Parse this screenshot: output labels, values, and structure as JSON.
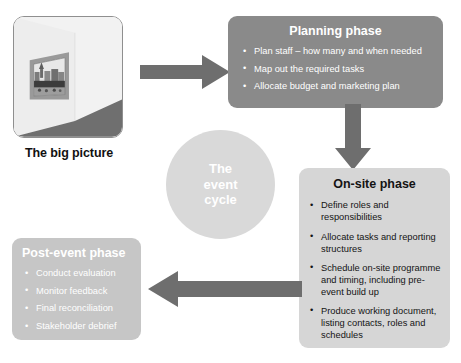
{
  "diagram": {
    "title": "The event cycle",
    "colors": {
      "dark_grey": "#8a8a8a",
      "mid_grey": "#c6c6c6",
      "light_grey": "#d6d6d6",
      "circle_grey": "#d9d9d9",
      "arrow_grey": "#6e6e6e",
      "text_dark": "#141414",
      "text_light": "#ffffff"
    }
  },
  "big_picture": {
    "label": "The big picture",
    "image_alt": "framed-painting-on-wall-in-room"
  },
  "center_circle": {
    "line1": "The",
    "line2": "event",
    "line3": "cycle"
  },
  "phases": [
    {
      "id": "planning",
      "title": "Planning phase",
      "bullets": [
        "Plan staff – how many and when needed",
        "Map out the required tasks",
        "Allocate budget and marketing plan"
      ]
    },
    {
      "id": "onsite",
      "title": "On-site phase",
      "bullets": [
        "Define roles and responsibilities",
        "Allocate tasks and reporting structures",
        "Schedule on-site programme and timing, including pre-event build up",
        "Produce working document, listing contacts, roles and schedules"
      ]
    },
    {
      "id": "postevent",
      "title": "Post-event phase",
      "bullets": [
        "Conduct evaluation",
        "Monitor feedback",
        "Final reconciliation",
        "Stakeholder debrief"
      ]
    }
  ],
  "arrows": [
    {
      "id": "arrow-bigpicture-to-planning",
      "direction": "right"
    },
    {
      "id": "arrow-planning-to-onsite",
      "direction": "down"
    },
    {
      "id": "arrow-onsite-to-postevent",
      "direction": "left"
    }
  ]
}
